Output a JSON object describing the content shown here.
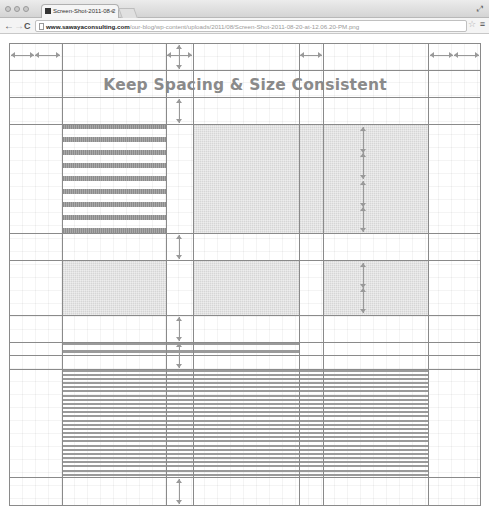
{
  "browser": {
    "tab": {
      "title": "Screen-Shot-2011-08-2",
      "close_glyph": "×"
    },
    "toolbar": {
      "back_glyph": "←",
      "forward_glyph": "→",
      "reload_glyph": "C",
      "url_domain": "www.sawayaconsulting.com",
      "url_path": "/our-blog/wp-content/uploads/2011/08/Screen-Shot-2011-08-20-at-12.06.20-PM.png",
      "star_glyph": "☆",
      "menu_glyph": "≡",
      "fullscreen_glyph": "⤢"
    }
  },
  "image": {
    "title": "Keep Spacing & Size Consistent",
    "colors": {
      "gridline": "#8a8a8a",
      "block_fill": "#d6d6d6",
      "bar_fill": "#8c8c8c",
      "title_text": "#8a8a8a"
    },
    "columns_x": [
      9,
      62,
      166,
      193,
      299,
      323,
      428,
      480
    ],
    "rows_y": [
      43,
      70,
      97,
      124,
      233,
      260,
      315,
      342,
      355,
      369,
      477,
      505
    ],
    "striped_block_bar_count": 9,
    "text_block_line_count": 26
  }
}
